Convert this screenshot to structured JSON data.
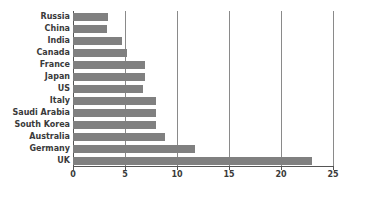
{
  "chart_data": {
    "type": "bar",
    "orientation": "horizontal",
    "title": "",
    "subtitle": "",
    "xlabel": "",
    "ylabel": "",
    "categories": [
      "Russia",
      "China",
      "India",
      "Canada",
      "France",
      "Japan",
      "US",
      "Italy",
      "Saudi Arabia",
      "South Korea",
      "Australia",
      "Germany",
      "UK"
    ],
    "values": [
      3.4,
      3.3,
      4.7,
      5.2,
      6.9,
      6.9,
      6.7,
      8.0,
      8.0,
      8.0,
      8.8,
      11.7,
      23.0
    ],
    "xticks": [
      0,
      5,
      10,
      15,
      20,
      25
    ],
    "xtick_labels": [
      "0",
      "5",
      "10",
      "15",
      "20",
      "25"
    ],
    "xlim": [
      0,
      25
    ],
    "grid": true,
    "grid_axis": "x",
    "legend": false,
    "bar_color": "#808080",
    "axis_color": "#555555",
    "grid_color": "#8a8a8a",
    "label_color": "#3a3a3a",
    "background": "#ffffff"
  }
}
